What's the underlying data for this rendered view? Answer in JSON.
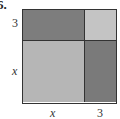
{
  "problem_number": "6.",
  "labels": {
    "left_top": "3",
    "left_bottom": "x",
    "bottom_left": "x",
    "bottom_right": "3"
  },
  "regions": [
    {
      "name": "x-by-3",
      "color": "#7d7d7d"
    },
    {
      "name": "3-by-3",
      "color": "#c4c4c4"
    },
    {
      "name": "x-by-x",
      "color": "#b6b6b6"
    },
    {
      "name": "3-by-x",
      "color": "#7a7a7a"
    }
  ]
}
